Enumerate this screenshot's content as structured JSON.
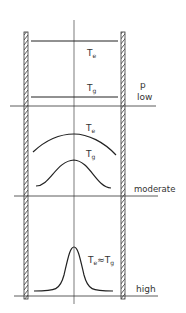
{
  "diagram": {
    "pressure_label": "p",
    "regimes": [
      {
        "name": "low",
        "label": "low",
        "curve_labels": {
          "electron": "T",
          "electron_sub": "e",
          "gas": "T",
          "gas_sub": "g"
        }
      },
      {
        "name": "moderate",
        "label": "moderate",
        "curve_labels": {
          "electron": "T",
          "electron_sub": "e",
          "gas": "T",
          "gas_sub": "g"
        }
      },
      {
        "name": "high",
        "label": "high",
        "curve_labels": {
          "combined": "T",
          "combined_sub1": "e",
          "approx": "≈",
          "combined2": "T",
          "combined_sub2": "g"
        }
      }
    ],
    "colors": {
      "line": "#222222",
      "background": "#ffffff"
    }
  }
}
